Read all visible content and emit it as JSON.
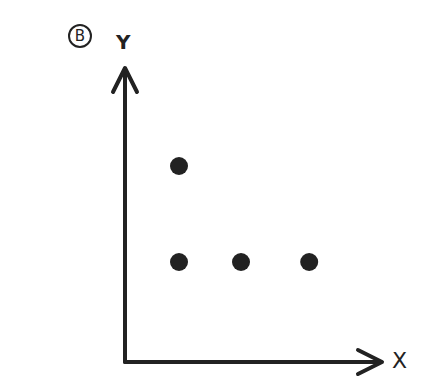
{
  "panel_label": "B",
  "axes": {
    "x_label": "X",
    "y_label": "Y",
    "color": "#222222"
  },
  "chart_data": {
    "type": "scatter",
    "title": "",
    "xlabel": "X",
    "ylabel": "Y",
    "grid": false,
    "points": [
      {
        "x": 1,
        "y": 2
      },
      {
        "x": 1,
        "y": 1
      },
      {
        "x": 2,
        "y": 1
      },
      {
        "x": 3.1,
        "y": 1
      }
    ],
    "point_color": "#222222"
  }
}
